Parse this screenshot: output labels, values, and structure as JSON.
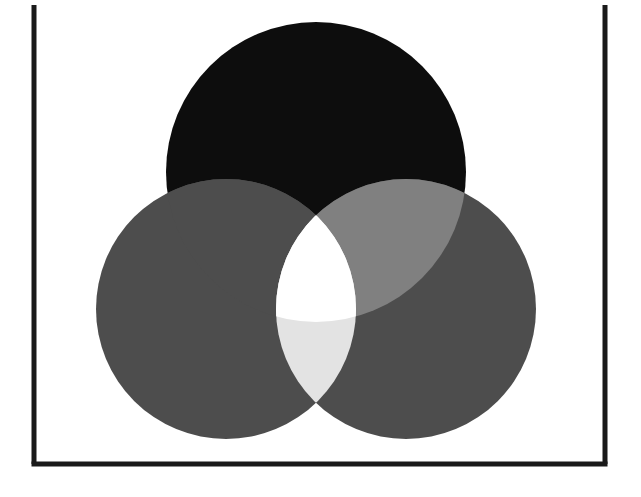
{
  "figure": {
    "title": "",
    "background": "#ffffff",
    "width": 641,
    "height": 497
  },
  "axes": {
    "spine_color": "#1a1a1a",
    "spine_width": 5,
    "left_spine_x": 34,
    "right_spine_x": 605,
    "bottom_spine_y": 464,
    "top_y": 5,
    "xlabel": "",
    "ylabel": "",
    "xticks": [],
    "yticks": [],
    "grid": false
  },
  "chart_data": {
    "type": "venn",
    "title": "",
    "xlabel": "",
    "ylabel": "",
    "grid": false,
    "legend": null,
    "xlim": [
      34,
      605
    ],
    "ylim": [
      464,
      5
    ],
    "background": "#ffffff",
    "sets": [
      {
        "name": "top-circle",
        "label": "",
        "cx": 316,
        "cy": 172,
        "r": 150,
        "color": "#0d0d0d"
      },
      {
        "name": "left-circle",
        "label": "",
        "cx": 226,
        "cy": 309,
        "r": 130,
        "color": "#4d4d4d"
      },
      {
        "name": "right-circle",
        "label": "",
        "cx": 406,
        "cy": 309,
        "r": 130,
        "color": "#4d4d4d"
      }
    ],
    "regions": [
      {
        "name": "top-only",
        "members": [
          "top"
        ],
        "color": "#0d0d0d"
      },
      {
        "name": "left-only",
        "members": [
          "left"
        ],
        "color": "#4d4d4d"
      },
      {
        "name": "right-only",
        "members": [
          "right"
        ],
        "color": "#4d4d4d"
      },
      {
        "name": "top-and-left",
        "members": [
          "top",
          "left"
        ],
        "color": "#4d4d4d"
      },
      {
        "name": "top-and-right",
        "members": [
          "top",
          "right"
        ],
        "color": "#808080"
      },
      {
        "name": "left-and-right",
        "members": [
          "left",
          "right"
        ],
        "color": "#e3e3e3"
      },
      {
        "name": "all-three",
        "members": [
          "top",
          "left",
          "right"
        ],
        "color": "#ffffff"
      }
    ]
  }
}
